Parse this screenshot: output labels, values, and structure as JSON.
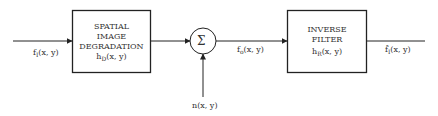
{
  "diagram": {
    "type": "block-diagram",
    "input": {
      "base": "f",
      "sub": "I",
      "args": "(x, y)"
    },
    "block1": {
      "lines": [
        "SPATIAL",
        "IMAGE",
        "DEGRADATION"
      ],
      "func_base": "h",
      "func_sub": "D",
      "func_args": "(x, y)"
    },
    "summer": {
      "symbol": "Σ"
    },
    "noise": {
      "label": "n(x, y)"
    },
    "intermediate": {
      "base": "f",
      "sub": "o",
      "args": "(x, y)"
    },
    "block2": {
      "lines": [
        "INVERSE",
        "FILTER"
      ],
      "func_base": "h",
      "func_sub": "R",
      "func_args": "(x, y)"
    },
    "output": {
      "base": "f̂",
      "sub": "I",
      "args": "(x, y)"
    },
    "colors": {
      "stroke": "#222222",
      "text": "#333333",
      "background": "#ffffff"
    }
  }
}
